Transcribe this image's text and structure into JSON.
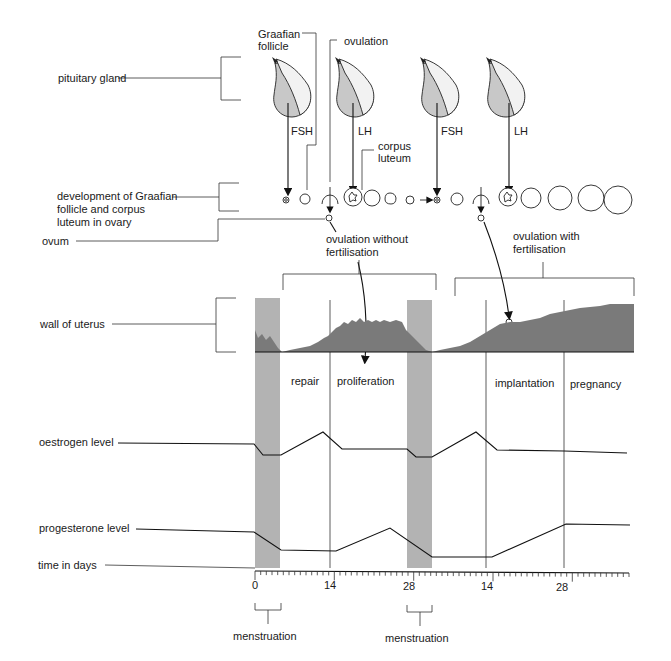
{
  "left_labels": {
    "pituitary": "pituitary gland",
    "development_1": "development of Graafian",
    "development_2": "follicle and corpus",
    "development_3": "luteum in ovary",
    "ovum": "ovum",
    "uterus": "wall of uterus",
    "oestrogen": "oestrogen level",
    "progesterone": "progesterone level",
    "time": "time in days"
  },
  "top_labels": {
    "graafian_1": "Graafian",
    "graafian_2": "follicle",
    "ovulation": "ovulation",
    "corpus_1": "corpus",
    "corpus_2": "luteum"
  },
  "hormones": [
    "FSH",
    "LH",
    "FSH",
    "LH"
  ],
  "cycle_labels": {
    "without_1": "ovulation without",
    "without_2": "fertilisation",
    "with_1": "ovulation with",
    "with_2": "fertilisation"
  },
  "phases": [
    "repair",
    "proliferation",
    "implantation",
    "pregnancy"
  ],
  "time_axis": {
    "ticks": [
      "0",
      "14",
      "28",
      "14",
      "28"
    ]
  },
  "menstruation_labels": [
    "menstruation",
    "menstruation"
  ],
  "colors": {
    "menstruation_band": "#b3b3b3",
    "pituitary_shade": "#c8c8c8",
    "uterus_fill": "#7a7a7a"
  }
}
